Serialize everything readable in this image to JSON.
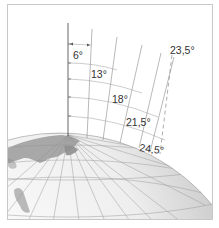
{
  "diagram": {
    "type": "globe-angle-diagram",
    "angle_labels": [
      {
        "id": "a1",
        "text": "6°"
      },
      {
        "id": "a2",
        "text": "13°"
      },
      {
        "id": "a3",
        "text": "18°"
      },
      {
        "id": "a4",
        "text": "21,5°"
      },
      {
        "id": "a5",
        "text": "24,5°"
      },
      {
        "id": "a6",
        "text": "23,5°"
      }
    ],
    "colors": {
      "frame": "#c8c8c8",
      "lines": "#8a8a8a",
      "axis": "#555555",
      "globe_light": "#f4f4f4",
      "globe_dark": "#9a9a9a",
      "land": "#8f8f8f"
    }
  }
}
